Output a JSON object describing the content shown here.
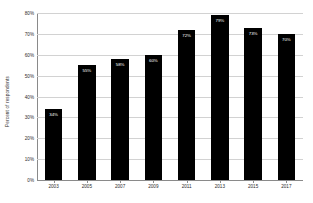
{
  "chart_data": {
    "type": "bar",
    "title": "",
    "subtitle": "",
    "xlabel": "",
    "ylabel": "Percent of respondents",
    "categories": [
      "2003",
      "2005",
      "2007",
      "2009",
      "2011",
      "2013",
      "2015",
      "2017"
    ],
    "values": [
      34,
      55,
      58,
      60,
      72,
      79,
      73,
      70
    ],
    "data_labels": [
      "34%",
      "55%",
      "58%",
      "60%",
      "72%",
      "79%",
      "73%",
      "70%"
    ],
    "ylim": [
      0,
      80
    ],
    "ytick_values": [
      0,
      10,
      20,
      30,
      40,
      50,
      60,
      70,
      80
    ],
    "ytick_labels": [
      "0%",
      "10%",
      "20%",
      "30%",
      "40%",
      "50%",
      "60%",
      "70%",
      "80%"
    ],
    "grid": true,
    "grid_axis": "y",
    "legend": false,
    "legend_position": "none",
    "bar_color": "#000000",
    "data_label_color": "#ffffff",
    "gridline_color": "#d2d2d2",
    "axis_color": "#8a8a8a",
    "background_color": "#ffffff"
  }
}
